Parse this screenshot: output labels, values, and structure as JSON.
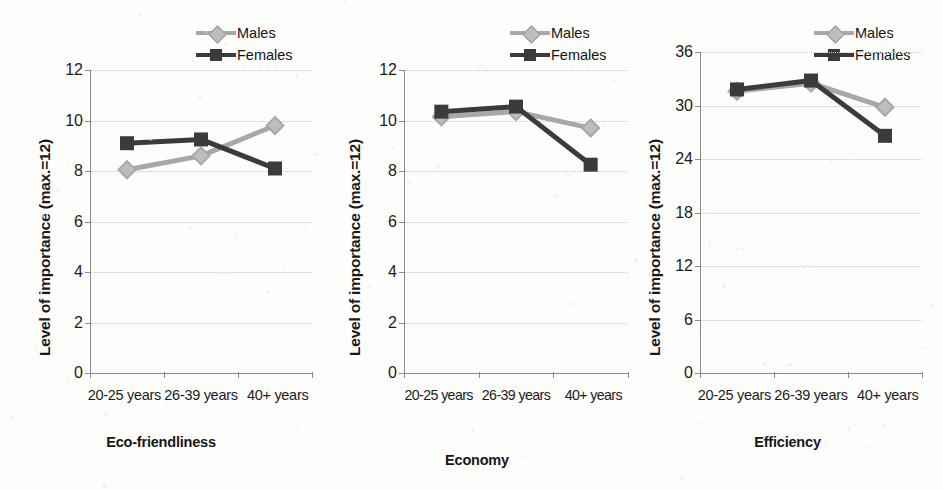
{
  "legend": {
    "series": [
      {
        "name": "Males",
        "marker": "diamond",
        "color": "#a8a8a8"
      },
      {
        "name": "Females",
        "marker": "square",
        "color": "#3b3b3b"
      }
    ]
  },
  "panels": [
    {
      "id": "eco-friendliness",
      "subtitle": "Eco-friendliness",
      "ylabel": "Level of importance (max.=12)",
      "categories": [
        "20-25 years",
        "26-39 years",
        "40+ years"
      ],
      "yticks": [
        0,
        2,
        4,
        6,
        8,
        10,
        12
      ],
      "ymin": 0,
      "ymax": 12
    },
    {
      "id": "economy",
      "subtitle": "Economy",
      "ylabel": "Level of importance (max.=12)",
      "categories": [
        "20-25 years",
        "26-39 years",
        "40+ years"
      ],
      "yticks": [
        0,
        2,
        4,
        6,
        8,
        10,
        12
      ],
      "ymin": 0,
      "ymax": 12
    },
    {
      "id": "efficiency",
      "subtitle": "Efficiency",
      "ylabel": "Level of importance (max.=12)",
      "categories": [
        "20-25 years",
        "26-39 years",
        "40+ years"
      ],
      "yticks": [
        0,
        6,
        12,
        18,
        24,
        30,
        36
      ],
      "ymin": 0,
      "ymax": 36
    }
  ],
  "chart_data": [
    {
      "type": "line",
      "title": "Eco-friendliness",
      "xlabel": "",
      "ylabel": "Level of importance (max.=12)",
      "categories": [
        "20-25 years",
        "26-39 years",
        "40+ years"
      ],
      "ylim": [
        0,
        12
      ],
      "yticks": [
        0,
        2,
        4,
        6,
        8,
        10,
        12
      ],
      "grid": true,
      "legend_position": "top-right",
      "series": [
        {
          "name": "Males",
          "values": [
            8.05,
            8.6,
            9.8
          ],
          "color": "#a8a8a8",
          "marker": "diamond"
        },
        {
          "name": "Females",
          "values": [
            9.1,
            9.25,
            8.1
          ],
          "color": "#3b3b3b",
          "marker": "square"
        }
      ]
    },
    {
      "type": "line",
      "title": "Economy",
      "xlabel": "",
      "ylabel": "Level of importance (max.=12)",
      "categories": [
        "20-25 years",
        "26-39 years",
        "40+ years"
      ],
      "ylim": [
        0,
        12
      ],
      "yticks": [
        0,
        2,
        4,
        6,
        8,
        10,
        12
      ],
      "grid": true,
      "legend_position": "top-right",
      "series": [
        {
          "name": "Males",
          "values": [
            10.15,
            10.35,
            9.7
          ],
          "color": "#a8a8a8",
          "marker": "diamond"
        },
        {
          "name": "Females",
          "values": [
            10.35,
            10.55,
            8.25
          ],
          "color": "#3b3b3b",
          "marker": "square"
        }
      ]
    },
    {
      "type": "line",
      "title": "Efficiency",
      "xlabel": "",
      "ylabel": "Level of importance (max.=12)",
      "categories": [
        "20-25 years",
        "26-39 years",
        "40+ years"
      ],
      "ylim": [
        0,
        36
      ],
      "yticks": [
        0,
        6,
        12,
        18,
        24,
        30,
        36
      ],
      "grid": true,
      "legend_position": "top-right",
      "series": [
        {
          "name": "Males",
          "values": [
            31.6,
            32.5,
            29.8
          ],
          "color": "#a8a8a8",
          "marker": "diamond"
        },
        {
          "name": "Females",
          "values": [
            31.8,
            32.8,
            26.6
          ],
          "color": "#3b3b3b",
          "marker": "square"
        }
      ]
    }
  ]
}
